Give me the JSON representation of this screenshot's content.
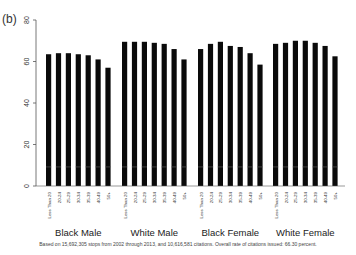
{
  "panel_label": "(b)",
  "footnote": "Based on 15,692,305 stops from 2002 through 2013, and 10,616,581 citations. Overall rate of citations issued: 66.30 percent.",
  "colors": {
    "bar": "#0a0a0a",
    "axis": "#555555",
    "text": "#333333",
    "band": "#555555"
  },
  "chart_data": {
    "type": "bar",
    "title": "",
    "xlabel": "",
    "ylabel": "",
    "ylim": [
      0,
      80
    ],
    "yticks": [
      0,
      20,
      40,
      60,
      80
    ],
    "grid": false,
    "legend": null,
    "categories": [
      "Less Than 20",
      "20-24",
      "25-29",
      "30-34",
      "35-39",
      "40-49",
      "50+"
    ],
    "groups": [
      "Black Male",
      "White Male",
      "Black Female",
      "White Female"
    ],
    "series": [
      {
        "name": "Black Male",
        "values": [
          63.5,
          64,
          64,
          63.5,
          63,
          61,
          57
        ]
      },
      {
        "name": "White Male",
        "values": [
          69.5,
          69.5,
          69.5,
          69,
          68.5,
          66,
          61
        ]
      },
      {
        "name": "Black Female",
        "values": [
          66,
          68.5,
          69.5,
          67.5,
          67,
          64,
          58.5
        ]
      },
      {
        "name": "White Female",
        "values": [
          68.5,
          69,
          70,
          70,
          69,
          67.5,
          62.5
        ]
      }
    ]
  }
}
